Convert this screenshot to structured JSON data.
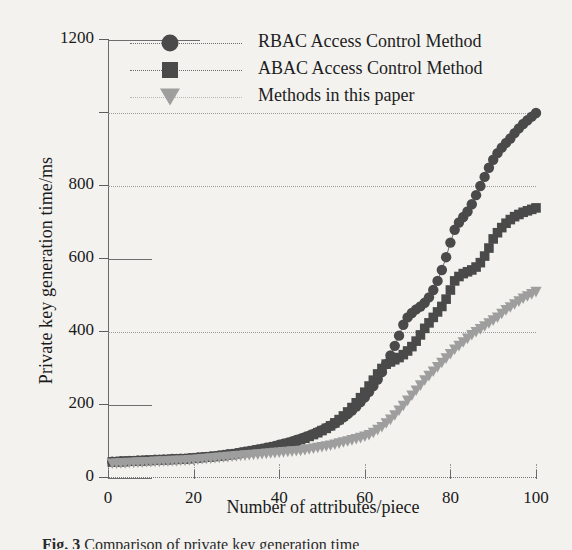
{
  "figure": {
    "caption": "Fig. 3",
    "caption_rest": "  Comparison of private key generation time"
  },
  "chart_data": {
    "type": "line",
    "title": "",
    "xlabel": "Number of attributes/piece",
    "ylabel": "Private key generation time/ms",
    "xlim": [
      0,
      100
    ],
    "ylim": [
      0,
      1200
    ],
    "grid": true,
    "legend_position": "top-left-inside",
    "xticks": [
      {
        "value": 0,
        "label": "0"
      },
      {
        "value": 20,
        "label": "20"
      },
      {
        "value": 40,
        "label": "40"
      },
      {
        "value": 60,
        "label": "60"
      },
      {
        "value": 80,
        "label": "80"
      },
      {
        "value": 100,
        "label": "100"
      }
    ],
    "yticks": [
      {
        "value": 0,
        "label": "0",
        "style": "solid"
      },
      {
        "value": 200,
        "label": "200",
        "style": "solid"
      },
      {
        "value": 400,
        "label": "400",
        "style": "dotted"
      },
      {
        "value": 600,
        "label": "600",
        "style": "solid"
      },
      {
        "value": 800,
        "label": "800",
        "style": "dotted"
      },
      {
        "value": 1000,
        "label": "",
        "style": "dotted"
      },
      {
        "value": 1200,
        "label": "1200",
        "style": "solid"
      }
    ],
    "x": [
      1,
      2,
      3,
      4,
      5,
      6,
      7,
      8,
      9,
      10,
      11,
      12,
      13,
      14,
      15,
      16,
      17,
      18,
      19,
      20,
      21,
      22,
      23,
      24,
      25,
      26,
      27,
      28,
      29,
      30,
      31,
      32,
      33,
      34,
      35,
      36,
      37,
      38,
      39,
      40,
      41,
      42,
      43,
      44,
      45,
      46,
      47,
      48,
      49,
      50,
      51,
      52,
      53,
      54,
      55,
      56,
      57,
      58,
      59,
      60,
      61,
      62,
      63,
      64,
      65,
      66,
      67,
      68,
      69,
      70,
      71,
      72,
      73,
      74,
      75,
      76,
      77,
      78,
      79,
      80,
      81,
      82,
      83,
      84,
      85,
      86,
      87,
      88,
      89,
      90,
      91,
      92,
      93,
      94,
      95,
      96,
      97,
      98,
      99,
      100
    ],
    "series": [
      {
        "name": "RBAC Access Control Method",
        "marker": "circle",
        "color": "#4a4a4a",
        "line_color": "#6d6d6d",
        "values": [
          45,
          45,
          46,
          46,
          47,
          47,
          48,
          48,
          49,
          49,
          50,
          50,
          51,
          51,
          52,
          52,
          53,
          53,
          54,
          55,
          56,
          57,
          58,
          59,
          60,
          62,
          63,
          65,
          66,
          68,
          70,
          72,
          74,
          76,
          78,
          80,
          83,
          85,
          88,
          91,
          94,
          97,
          100,
          104,
          108,
          112,
          116,
          121,
          126,
          131,
          137,
          143,
          150,
          158,
          166,
          175,
          185,
          196,
          208,
          221,
          236,
          252,
          270,
          290,
          312,
          336,
          362,
          390,
          420,
          440,
          452,
          462,
          470,
          480,
          495,
          515,
          540,
          570,
          605,
          645,
          680,
          700,
          715,
          730,
          750,
          775,
          800,
          825,
          850,
          872,
          890,
          905,
          918,
          930,
          945,
          958,
          970,
          980,
          990,
          1000
        ]
      },
      {
        "name": "ABAC Access Control Method",
        "marker": "square",
        "color": "#4a4a4a",
        "line_color": "#6d6d6d",
        "values": [
          44,
          44,
          45,
          45,
          46,
          46,
          47,
          47,
          48,
          48,
          49,
          49,
          50,
          50,
          51,
          51,
          52,
          52,
          53,
          54,
          55,
          56,
          57,
          58,
          59,
          60,
          61,
          63,
          64,
          66,
          68,
          70,
          72,
          74,
          76,
          78,
          80,
          83,
          85,
          88,
          91,
          94,
          97,
          101,
          105,
          109,
          114,
          119,
          124,
          130,
          136,
          143,
          151,
          160,
          170,
          181,
          193,
          206,
          220,
          235,
          252,
          268,
          285,
          300,
          312,
          318,
          324,
          330,
          338,
          348,
          360,
          375,
          392,
          410,
          425,
          440,
          455,
          470,
          490,
          515,
          540,
          552,
          560,
          565,
          570,
          578,
          590,
          608,
          630,
          655,
          672,
          686,
          698,
          708,
          716,
          722,
          728,
          732,
          736,
          740
        ]
      },
      {
        "name": "Methods in this paper",
        "marker": "triangle-down",
        "color": "#9e9e9e",
        "line_color": "#b4b4b4",
        "values": [
          40,
          40,
          41,
          41,
          42,
          42,
          43,
          43,
          44,
          44,
          45,
          45,
          46,
          46,
          47,
          47,
          48,
          48,
          49,
          50,
          51,
          52,
          53,
          54,
          55,
          56,
          57,
          58,
          59,
          60,
          61,
          62,
          63,
          64,
          65,
          66,
          67,
          68,
          69,
          70,
          71,
          72,
          73,
          74,
          75,
          77,
          79,
          81,
          83,
          85,
          87,
          89,
          92,
          95,
          98,
          101,
          104,
          107,
          110,
          114,
          118,
          124,
          132,
          140,
          150,
          160,
          172,
          185,
          198,
          212,
          226,
          240,
          254,
          268,
          280,
          292,
          304,
          316,
          328,
          340,
          352,
          362,
          372,
          382,
          392,
          400,
          408,
          416,
          424,
          432,
          440,
          450,
          460,
          468,
          476,
          484,
          492,
          498,
          504,
          510
        ]
      }
    ]
  }
}
